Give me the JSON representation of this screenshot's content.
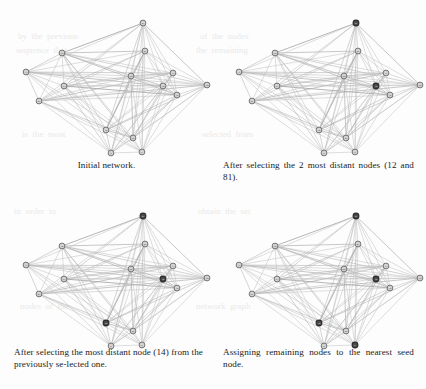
{
  "figure": {
    "panels": [
      {
        "id": "initial-network",
        "caption": "Initial network.",
        "align": "center",
        "highlighted_nodes": []
      },
      {
        "id": "two-most-distant",
        "caption": "After selecting the 2 most distant nodes (12 and 81).",
        "align": "justify",
        "highlighted_nodes": [
          "12",
          "81"
        ]
      },
      {
        "id": "third-most-distant",
        "caption": "After selecting the most distant node (14) from the previously se-lected one.",
        "align": "justify",
        "highlighted_nodes": [
          "12",
          "81",
          "14"
        ]
      },
      {
        "id": "assign-remaining",
        "caption": "Assigning remaining nodes to the nearest seed node.",
        "align": "justify",
        "highlighted_nodes": [
          "12",
          "81",
          "14",
          "6"
        ]
      }
    ]
  },
  "colors": {
    "background": "#fdfdfd",
    "edge": "#bdbdbd",
    "edge_strong": "#a8a8a8",
    "node_fill": "#d4d4d4",
    "node_stroke": "#5a5a5a",
    "node_highlight_fill": "#4a4a4a",
    "node_highlight_stroke": "#2b2b2b",
    "caption_text": "#1a1a1a",
    "bleed_text": "#e9e9e9"
  },
  "graph": {
    "node_count": 15,
    "nodes": [
      {
        "id": "n1",
        "label": "81",
        "x": 143,
        "y": 23
      },
      {
        "id": "n2",
        "label": "55",
        "x": 62,
        "y": 53
      },
      {
        "id": "n3",
        "label": "47",
        "x": 145,
        "y": 51
      },
      {
        "id": "n4",
        "label": "33",
        "x": 26,
        "y": 72
      },
      {
        "id": "n5",
        "label": "29",
        "x": 131,
        "y": 76
      },
      {
        "id": "n6",
        "label": "17",
        "x": 173,
        "y": 73
      },
      {
        "id": "n7",
        "label": "63",
        "x": 64,
        "y": 86
      },
      {
        "id": "n8",
        "label": "12",
        "x": 163,
        "y": 86
      },
      {
        "id": "n9",
        "label": "74",
        "x": 207,
        "y": 85
      },
      {
        "id": "n10",
        "label": "38",
        "x": 177,
        "y": 95
      },
      {
        "id": "n11",
        "label": "41",
        "x": 39,
        "y": 101
      },
      {
        "id": "n12",
        "label": "14",
        "x": 106,
        "y": 130
      },
      {
        "id": "n13",
        "label": "26",
        "x": 133,
        "y": 138
      },
      {
        "id": "n14",
        "label": "6",
        "x": 142,
        "y": 152
      },
      {
        "id": "n15",
        "label": "9",
        "x": 111,
        "y": 153
      }
    ],
    "edges": [
      [
        "n1",
        "n2"
      ],
      [
        "n1",
        "n3"
      ],
      [
        "n1",
        "n4"
      ],
      [
        "n1",
        "n5"
      ],
      [
        "n1",
        "n6"
      ],
      [
        "n1",
        "n7"
      ],
      [
        "n1",
        "n8"
      ],
      [
        "n1",
        "n9"
      ],
      [
        "n1",
        "n10"
      ],
      [
        "n1",
        "n11"
      ],
      [
        "n1",
        "n12"
      ],
      [
        "n1",
        "n13"
      ],
      [
        "n1",
        "n14"
      ],
      [
        "n1",
        "n15"
      ],
      [
        "n2",
        "n3"
      ],
      [
        "n2",
        "n4"
      ],
      [
        "n2",
        "n5"
      ],
      [
        "n2",
        "n6"
      ],
      [
        "n2",
        "n7"
      ],
      [
        "n2",
        "n8"
      ],
      [
        "n2",
        "n9"
      ],
      [
        "n2",
        "n10"
      ],
      [
        "n2",
        "n11"
      ],
      [
        "n2",
        "n12"
      ],
      [
        "n2",
        "n13"
      ],
      [
        "n2",
        "n14"
      ],
      [
        "n2",
        "n15"
      ],
      [
        "n3",
        "n4"
      ],
      [
        "n3",
        "n5"
      ],
      [
        "n3",
        "n6"
      ],
      [
        "n3",
        "n7"
      ],
      [
        "n3",
        "n8"
      ],
      [
        "n3",
        "n9"
      ],
      [
        "n3",
        "n10"
      ],
      [
        "n3",
        "n11"
      ],
      [
        "n3",
        "n12"
      ],
      [
        "n3",
        "n13"
      ],
      [
        "n3",
        "n14"
      ],
      [
        "n3",
        "n15"
      ],
      [
        "n4",
        "n5"
      ],
      [
        "n4",
        "n6"
      ],
      [
        "n4",
        "n7"
      ],
      [
        "n4",
        "n8"
      ],
      [
        "n4",
        "n9"
      ],
      [
        "n4",
        "n10"
      ],
      [
        "n4",
        "n11"
      ],
      [
        "n4",
        "n12"
      ],
      [
        "n4",
        "n13"
      ],
      [
        "n4",
        "n15"
      ],
      [
        "n5",
        "n6"
      ],
      [
        "n5",
        "n7"
      ],
      [
        "n5",
        "n8"
      ],
      [
        "n5",
        "n9"
      ],
      [
        "n5",
        "n10"
      ],
      [
        "n5",
        "n11"
      ],
      [
        "n5",
        "n12"
      ],
      [
        "n5",
        "n13"
      ],
      [
        "n5",
        "n14"
      ],
      [
        "n5",
        "n15"
      ],
      [
        "n6",
        "n7"
      ],
      [
        "n6",
        "n8"
      ],
      [
        "n6",
        "n9"
      ],
      [
        "n6",
        "n10"
      ],
      [
        "n6",
        "n11"
      ],
      [
        "n6",
        "n12"
      ],
      [
        "n6",
        "n13"
      ],
      [
        "n6",
        "n14"
      ],
      [
        "n6",
        "n15"
      ],
      [
        "n7",
        "n8"
      ],
      [
        "n7",
        "n9"
      ],
      [
        "n7",
        "n10"
      ],
      [
        "n7",
        "n11"
      ],
      [
        "n7",
        "n12"
      ],
      [
        "n7",
        "n13"
      ],
      [
        "n7",
        "n14"
      ],
      [
        "n7",
        "n15"
      ],
      [
        "n8",
        "n9"
      ],
      [
        "n8",
        "n10"
      ],
      [
        "n8",
        "n11"
      ],
      [
        "n8",
        "n12"
      ],
      [
        "n8",
        "n13"
      ],
      [
        "n8",
        "n14"
      ],
      [
        "n8",
        "n15"
      ],
      [
        "n9",
        "n10"
      ],
      [
        "n9",
        "n11"
      ],
      [
        "n9",
        "n12"
      ],
      [
        "n9",
        "n13"
      ],
      [
        "n9",
        "n14"
      ],
      [
        "n9",
        "n15"
      ],
      [
        "n10",
        "n11"
      ],
      [
        "n10",
        "n12"
      ],
      [
        "n10",
        "n13"
      ],
      [
        "n10",
        "n14"
      ],
      [
        "n10",
        "n15"
      ],
      [
        "n11",
        "n12"
      ],
      [
        "n11",
        "n13"
      ],
      [
        "n11",
        "n14"
      ],
      [
        "n11",
        "n15"
      ],
      [
        "n12",
        "n13"
      ],
      [
        "n12",
        "n14"
      ],
      [
        "n12",
        "n15"
      ],
      [
        "n13",
        "n14"
      ],
      [
        "n13",
        "n15"
      ],
      [
        "n14",
        "n15"
      ]
    ]
  },
  "bleed_through": {
    "visible": true,
    "lines": [
      {
        "text": "by  the  previous",
        "x": 18,
        "y": 30
      },
      {
        "text": "of  the  nodes",
        "x": 200,
        "y": 30
      },
      {
        "text": "sequence  that",
        "x": 16,
        "y": 44
      },
      {
        "text": "the  remaining",
        "x": 196,
        "y": 44
      },
      {
        "text": "is  the  most",
        "x": 22,
        "y": 128
      },
      {
        "text": "selected  from",
        "x": 202,
        "y": 128
      },
      {
        "text": "in  order  to",
        "x": 14,
        "y": 205
      },
      {
        "text": "obtain  the  set",
        "x": 198,
        "y": 205
      },
      {
        "text": "nodes  of  the",
        "x": 20,
        "y": 300
      },
      {
        "text": "network  graph",
        "x": 196,
        "y": 300
      }
    ]
  }
}
